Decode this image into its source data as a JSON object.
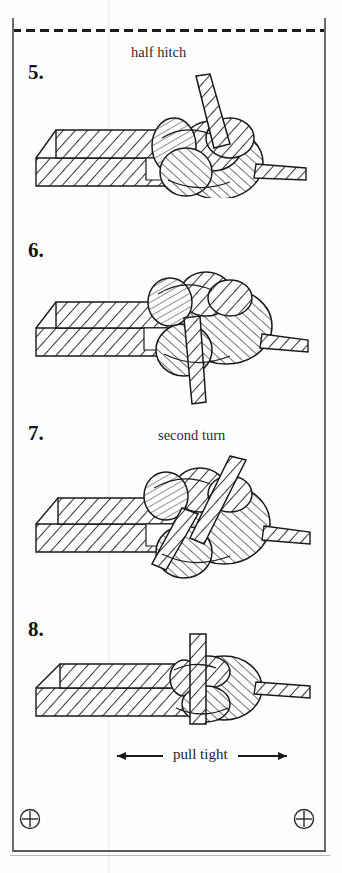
{
  "page": {
    "background_color": "#fefefe",
    "ink_color": "#1a1a1a",
    "frame_color": "#6b6b6b"
  },
  "frame": {
    "top_border_style": "dashed",
    "top_dash_label": "cut-here-dashed-rule",
    "left_border_style": "solid",
    "right_border_style": "solid",
    "bottom_border_style": "solid"
  },
  "registration_marks": [
    {
      "position": "bottom-left",
      "symbol": "crosshair-in-circle"
    },
    {
      "position": "bottom-right",
      "symbol": "crosshair-in-circle"
    }
  ],
  "steps": [
    {
      "number": "5.",
      "caption": "half hitch",
      "caption_x": 131,
      "caption_y": 44,
      "num_x": 28,
      "num_y": 60,
      "art_name": "knot-diagram-step-5"
    },
    {
      "number": "6.",
      "caption": "",
      "caption_x": 0,
      "caption_y": 0,
      "num_x": 28,
      "num_y": 238,
      "art_name": "knot-diagram-step-6"
    },
    {
      "number": "7.",
      "caption": "second turn",
      "caption_x": 158,
      "caption_y": 427,
      "num_x": 28,
      "num_y": 421,
      "art_name": "knot-diagram-step-7"
    },
    {
      "number": "8.",
      "caption": "",
      "caption_x": 0,
      "caption_y": 0,
      "num_x": 28,
      "num_y": 617,
      "art_name": "knot-diagram-step-8"
    }
  ],
  "annotation": {
    "pull_tight_label": "pull tight",
    "arrow_left": "arrow-left",
    "arrow_right": "arrow-right"
  }
}
